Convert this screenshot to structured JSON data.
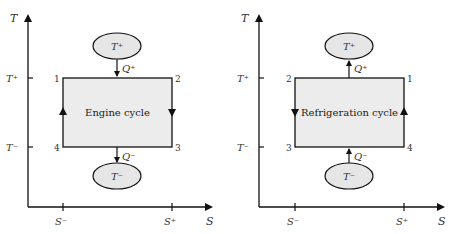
{
  "diagrams": [
    {
      "title": "Engine cycle",
      "axis": {
        "y_label": "T",
        "x_label": "S",
        "y_ticks": [
          "T⁺",
          "T⁻"
        ],
        "x_ticks": [
          "S⁻",
          "S⁺"
        ]
      },
      "corners": {
        "top_left": "1",
        "top_right": "2",
        "bottom_right": "3",
        "bottom_left": "4"
      },
      "hot_reservoir": "T⁺",
      "cold_reservoir": "T⁻",
      "heat_in": "Q⁺",
      "heat_out": "Q⁻",
      "colors": {
        "fill": "#ececec",
        "line": "#1a1a1a",
        "reservoir_fill": "#e6e6e6"
      }
    },
    {
      "title": "Refrigeration cycle",
      "axis": {
        "y_label": "T",
        "x_label": "S",
        "y_ticks": [
          "T⁺",
          "T⁻"
        ],
        "x_ticks": [
          "S⁻",
          "S⁺"
        ]
      },
      "corners": {
        "top_left": "2",
        "top_right": "1",
        "bottom_right": "4",
        "bottom_left": "3"
      },
      "hot_reservoir": "T⁺",
      "cold_reservoir": "T⁻",
      "heat_in": "Q⁺",
      "heat_out": "Q⁻",
      "colors": {
        "fill": "#ececec",
        "line": "#1a1a1a",
        "reservoir_fill": "#e6e6e6"
      }
    }
  ]
}
